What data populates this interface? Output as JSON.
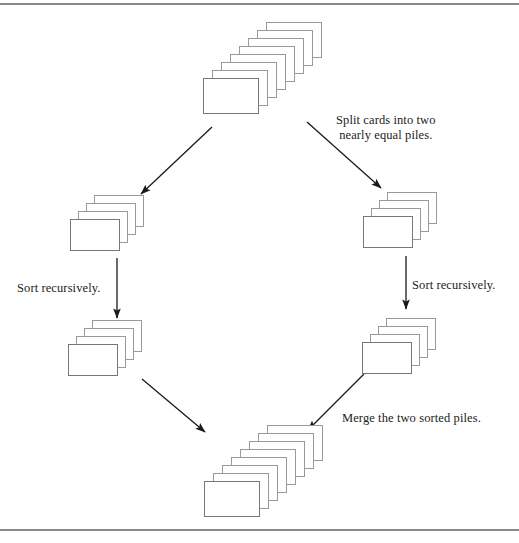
{
  "figure": {
    "width": 519,
    "height": 543,
    "background_color": "#ffffff",
    "rule_color": "#8a8a8a",
    "card_fill": "#ffffff",
    "card_stroke": "#9a9a9a",
    "arrow_color": "#1a1a1a",
    "text_color": "#1c1c1c"
  },
  "labels": {
    "split": "Split cards into two\nnearly equal piles.",
    "sort_left": "Sort recursively.",
    "sort_right": "Sort recursively.",
    "merge": "Merge the two sorted piles."
  },
  "piles": [
    {
      "id": "unsorted-deck",
      "name": "top-pile",
      "cards": 8,
      "front_x": 203,
      "front_y": 78,
      "card_w": 56,
      "card_h": 36,
      "step_x": 9,
      "step_y": -8
    },
    {
      "id": "left-half-unsorted",
      "name": "left-middle-pile",
      "cards": 4,
      "front_x": 70,
      "front_y": 219,
      "card_w": 50,
      "card_h": 32,
      "step_x": 8,
      "step_y": -8
    },
    {
      "id": "right-half-unsorted",
      "name": "right-middle-pile",
      "cards": 4,
      "front_x": 363,
      "front_y": 216,
      "card_w": 50,
      "card_h": 32,
      "step_x": 8,
      "step_y": -8
    },
    {
      "id": "left-half-sorted",
      "name": "lower-left-pile",
      "cards": 4,
      "front_x": 68,
      "front_y": 344,
      "card_w": 50,
      "card_h": 32,
      "step_x": 8,
      "step_y": -8
    },
    {
      "id": "right-half-sorted",
      "name": "lower-right-pile",
      "cards": 4,
      "front_x": 362,
      "front_y": 342,
      "card_w": 50,
      "card_h": 32,
      "step_x": 8,
      "step_y": -8
    },
    {
      "id": "merged-deck",
      "name": "bottom-pile",
      "cards": 8,
      "front_x": 204,
      "front_y": 481,
      "card_w": 56,
      "card_h": 36,
      "step_x": 9,
      "step_y": -8
    }
  ],
  "arrows": [
    {
      "id": "split-left",
      "name": "split-left-arrow",
      "x1": 212,
      "y1": 127,
      "x2": 141,
      "y2": 194
    },
    {
      "id": "split-right",
      "name": "split-right-arrow",
      "x1": 307,
      "y1": 122,
      "x2": 381,
      "y2": 188
    },
    {
      "id": "sort-left",
      "name": "sort-left-arrow",
      "x1": 117,
      "y1": 258,
      "x2": 117,
      "y2": 318
    },
    {
      "id": "sort-right",
      "name": "sort-right-arrow",
      "x1": 406,
      "y1": 256,
      "x2": 406,
      "y2": 309
    },
    {
      "id": "merge-left",
      "name": "merge-left-arrow",
      "x1": 142,
      "y1": 379,
      "x2": 205,
      "y2": 432
    },
    {
      "id": "merge-right",
      "name": "merge-right-arrow",
      "x1": 364,
      "y1": 374,
      "x2": 308,
      "y2": 430
    }
  ],
  "label_positions": {
    "split": {
      "x": 336,
      "y": 113
    },
    "sort_left": {
      "x": 17,
      "y": 281
    },
    "sort_right": {
      "x": 412,
      "y": 278
    },
    "merge": {
      "x": 342,
      "y": 411
    }
  }
}
